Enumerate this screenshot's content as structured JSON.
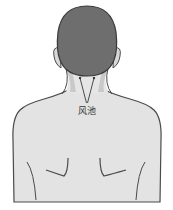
{
  "diagram": {
    "acupoint": {
      "label": "风池",
      "pointer_count": 2
    },
    "colors": {
      "hair": "#6e6e6e",
      "hair_outline": "#3a3a3a",
      "skin": "#e3e3e3",
      "skin_shadow": "#c9c9c9",
      "outline": "#4a4a4a",
      "label_text": "#333333",
      "background": "#ffffff"
    }
  }
}
